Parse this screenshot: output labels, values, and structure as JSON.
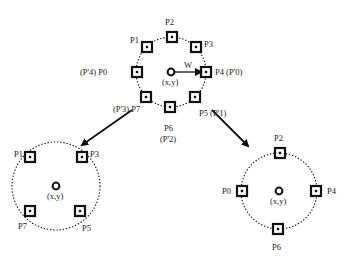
{
  "diagram": {
    "top": {
      "center": {
        "x": 171,
        "y": 72,
        "r": 35
      },
      "center_label": "(x,y)",
      "radius_label": "W",
      "points": [
        {
          "id": "P0",
          "label": "(P'4) P0",
          "x": 137,
          "y": 72,
          "lx": 80,
          "ly": 68
        },
        {
          "id": "P1",
          "label": "P1",
          "x": 147,
          "y": 47,
          "lx": 130,
          "ly": 36
        },
        {
          "id": "P2",
          "label": "P2",
          "x": 172,
          "y": 37,
          "lx": 165,
          "ly": 18
        },
        {
          "id": "P3",
          "label": "P3",
          "x": 196,
          "y": 47,
          "lx": 204,
          "ly": 40
        },
        {
          "id": "P4",
          "label": "P4 (P'0)",
          "x": 206,
          "y": 72,
          "lx": 215,
          "ly": 68
        },
        {
          "id": "P5",
          "label": "P5 (P'1)",
          "x": 195,
          "y": 97,
          "lx": 199,
          "ly": 109
        },
        {
          "id": "P6",
          "label": "P6",
          "x": 170,
          "y": 107,
          "lx": 164,
          "ly": 124
        },
        {
          "id": "P7",
          "label": "(P'3) P7",
          "x": 146,
          "y": 97,
          "lx": 113,
          "ly": 105
        }
      ],
      "extra_labels": [
        {
          "text": "(P'2)",
          "x": 160,
          "y": 135
        }
      ]
    },
    "bottom_left": {
      "center": {
        "x": 56,
        "y": 186,
        "r": 44
      },
      "center_label": "(x,y)",
      "points": [
        {
          "id": "P1",
          "label": "P1",
          "x": 30,
          "y": 157,
          "lx": 14,
          "ly": 150
        },
        {
          "id": "P3",
          "label": "P3",
          "x": 82,
          "y": 157,
          "lx": 90,
          "ly": 150
        },
        {
          "id": "P7",
          "label": "P7",
          "x": 30,
          "y": 211,
          "lx": 18,
          "ly": 222
        },
        {
          "id": "P5",
          "label": "P5",
          "x": 80,
          "y": 211,
          "lx": 82,
          "ly": 224
        }
      ]
    },
    "bottom_right": {
      "center": {
        "x": 279,
        "y": 191,
        "r": 38
      },
      "center_label": "(x,y)",
      "points": [
        {
          "id": "P2",
          "label": "P2",
          "x": 280,
          "y": 153,
          "lx": 274,
          "ly": 134
        },
        {
          "id": "P0",
          "label": "P0",
          "x": 242,
          "y": 191,
          "lx": 222,
          "ly": 187
        },
        {
          "id": "P4",
          "label": "P4",
          "x": 316,
          "y": 191,
          "lx": 327,
          "ly": 187
        },
        {
          "id": "P6",
          "label": "P6",
          "x": 278,
          "y": 229,
          "lx": 272,
          "ly": 243
        }
      ]
    },
    "arrows": [
      {
        "from": [
          132,
          110
        ],
        "to": [
          82,
          145
        ]
      },
      {
        "from": [
          212,
          110
        ],
        "to": [
          248,
          146
        ]
      }
    ],
    "colors": {
      "ink": "#111111",
      "bg": "#ffffff"
    }
  }
}
